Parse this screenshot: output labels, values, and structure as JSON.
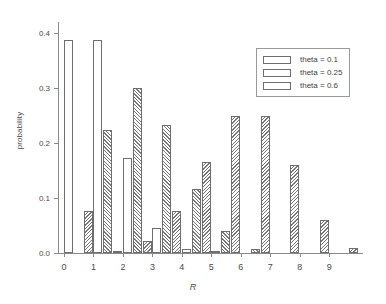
{
  "chart_data": {
    "type": "bar",
    "title": "",
    "subtitle": "",
    "xlabel": "R",
    "ylabel": "probability",
    "categories": [
      "0",
      "1",
      "2",
      "3",
      "4",
      "5",
      "6",
      "7",
      "8",
      "9"
    ],
    "xlim": [
      0,
      10
    ],
    "ylim": [
      0.0,
      0.42
    ],
    "ytick_labels": [
      "0.0",
      "0.1",
      "0.2",
      "0.3",
      "0.4"
    ],
    "ytick_values": [
      0.0,
      0.1,
      0.2,
      0.3,
      0.4
    ],
    "grid": false,
    "legend_position": "upper right",
    "series": [
      {
        "name": "theta = 0.1",
        "pattern": "none",
        "values": [
          0.387,
          0.387,
          0.172,
          0.046,
          0.008,
          0.001,
          0.0,
          0.0,
          0.0,
          0.0
        ]
      },
      {
        "name": "theta = 0.25",
        "pattern": "forward-hatch",
        "values": [
          0.0,
          0.224,
          0.3,
          0.233,
          0.116,
          0.04,
          0.008,
          0.0,
          0.0,
          0.0
        ]
      },
      {
        "name": "theta = 0.6",
        "pattern": "backward-hatch",
        "values": [
          0.077,
          0.003,
          0.022,
          0.077,
          0.166,
          0.25,
          0.25,
          0.16,
          0.06,
          0.01
        ]
      }
    ]
  },
  "legend": {
    "entries": [
      {
        "label": "theta = 0.1",
        "pattern": "none"
      },
      {
        "label": "theta = 0.25",
        "pattern": "forward-hatch"
      },
      {
        "label": "theta = 0.6",
        "pattern": "backward-hatch"
      }
    ]
  }
}
